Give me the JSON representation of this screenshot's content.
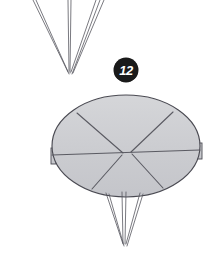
{
  "figure": {
    "step_number": "12",
    "caption": "",
    "colors": {
      "paper_fill": "#cccdd1",
      "paper_fill_light": "#d6d7da",
      "outline": "#4a4a52",
      "fold_line": "#55555d",
      "badge_fill": "#1a1a1a",
      "badge_text": "#ffffff",
      "background": "#ffffff"
    }
  },
  "top_shape": {
    "name": "narrow-cone-point",
    "description": "Thin converging creased point at top of previous model",
    "apex": {
      "x": 69,
      "y": 74
    },
    "lines": [
      {
        "x1": 33,
        "y1": 0,
        "x2": 68,
        "y2": 72
      },
      {
        "x1": 36,
        "y1": 0,
        "x2": 69,
        "y2": 74
      },
      {
        "x1": 68,
        "y1": 0,
        "x2": 69,
        "y2": 71
      },
      {
        "x1": 71,
        "y1": 0,
        "x2": 70,
        "y2": 73
      },
      {
        "x1": 96,
        "y1": 0,
        "x2": 71,
        "y2": 72
      },
      {
        "x1": 100,
        "y1": 0,
        "x2": 72,
        "y2": 74
      },
      {
        "x1": 104,
        "y1": 0,
        "x2": 73,
        "y2": 73
      }
    ]
  },
  "main_shape": {
    "name": "fanned-disc",
    "description": "Shaded ellipse formed by fanned paper sections with radial fold lines",
    "ellipse": {
      "cx": 126,
      "cy": 146,
      "rx": 74,
      "ry": 51
    },
    "center": {
      "x": 123,
      "y": 153
    },
    "center_right": {
      "x": 131,
      "y": 152
    },
    "fold_lines": [
      {
        "name": "horizontal-crease",
        "x1": 52,
        "y1": 155,
        "x2": 200,
        "y2": 150
      },
      {
        "name": "upper-left-radial",
        "x1": 77,
        "y1": 113,
        "x2": 123,
        "y2": 153
      },
      {
        "name": "upper-right-radial",
        "x1": 173,
        "y1": 112,
        "x2": 131,
        "y2": 152
      },
      {
        "name": "lower-left-radial",
        "x1": 92,
        "y1": 189,
        "x2": 122,
        "y2": 155
      },
      {
        "name": "lower-right-radial",
        "x1": 163,
        "y1": 188,
        "x2": 132,
        "y2": 154
      }
    ],
    "left_tab": {
      "x": 51,
      "y": 148,
      "w": 5,
      "h": 16
    },
    "right_tab": {
      "x": 196,
      "y": 143,
      "w": 6,
      "h": 16
    }
  },
  "bottom_shape": {
    "name": "narrow-cone-tail",
    "description": "Thin converging point extending below the disc",
    "apex": {
      "x": 124,
      "y": 246
    },
    "lines": [
      {
        "x1": 106,
        "y1": 193,
        "x2": 123,
        "y2": 244
      },
      {
        "x1": 109,
        "y1": 194,
        "x2": 124,
        "y2": 246
      },
      {
        "x1": 122,
        "y1": 192,
        "x2": 123,
        "y2": 243
      },
      {
        "x1": 126,
        "y1": 192,
        "x2": 125,
        "y2": 244
      },
      {
        "x1": 140,
        "y1": 193,
        "x2": 126,
        "y2": 244
      },
      {
        "x1": 143,
        "y1": 194,
        "x2": 127,
        "y2": 246
      }
    ]
  }
}
